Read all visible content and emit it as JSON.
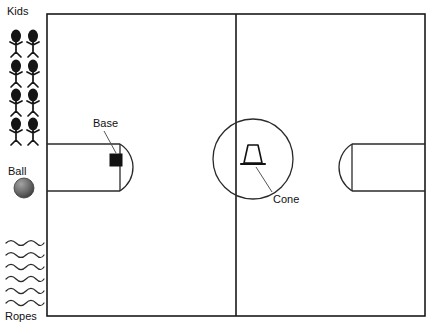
{
  "diagram": {
    "background_color": "#ffffff",
    "line_color": "#1a1a1a",
    "field": {
      "x": 47,
      "y": 14,
      "width": 378,
      "height": 302,
      "halfway_line_x": 236
    },
    "center_circle": {
      "cx": 253,
      "cy": 159,
      "r": 40
    },
    "left_goal_box": {
      "x": 47,
      "y": 144,
      "width": 73,
      "height": 47,
      "arc_bulge_x": 133
    },
    "right_goal_box": {
      "x": 352,
      "y": 144,
      "width": 73,
      "height": 47,
      "arc_bulge_x": 339
    }
  },
  "labels": {
    "kids": "Kids",
    "ball": "Ball",
    "ropes": "Ropes",
    "base": "Base",
    "cone": "Cone"
  },
  "legend_items": [
    {
      "key": "kids",
      "label": "Kids",
      "icon": "stick-figure-icon",
      "count": 8,
      "columns": 2,
      "rows": 4
    },
    {
      "key": "ball",
      "label": "Ball",
      "icon": "ball-icon",
      "count": 1
    },
    {
      "key": "ropes",
      "label": "Ropes",
      "icon": "wavy-rope-icon",
      "count": 6
    }
  ],
  "field_markers": [
    {
      "key": "base",
      "label": "Base",
      "icon": "square-marker-icon",
      "color": "#121212",
      "x": 116,
      "y": 160
    },
    {
      "key": "cone",
      "label": "Cone",
      "icon": "cone-icon",
      "color": "#111111",
      "x": 253,
      "y": 155
    }
  ],
  "colors": {
    "ink": "#1a1a1a",
    "marker": "#121212",
    "leader": "#555555",
    "ball_dark": "#4a4a4a",
    "ball_light": "#9a9a9a",
    "paper": "#ffffff"
  }
}
